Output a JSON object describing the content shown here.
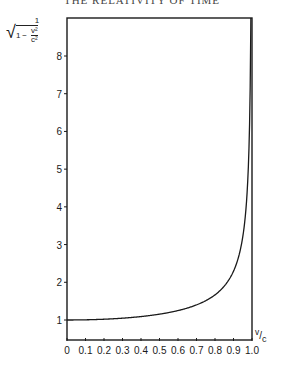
{
  "header": "THE RELATIVITY OF TIME",
  "chart_data": {
    "type": "line",
    "title": "",
    "ylabel": "1 / sqrt(1 - v^2/c^2)",
    "ylabel_parts": {
      "numerator": "1",
      "one": "1",
      "minus": "−",
      "v2": "v²",
      "c2": "c²"
    },
    "xlabel": "v/c",
    "xlabel_parts": {
      "v": "v",
      "slash": "/",
      "c": "c"
    },
    "xlim": [
      0,
      1.0
    ],
    "ylim": [
      0.5,
      9.2
    ],
    "grid": false,
    "legend": null,
    "x_ticks": [
      "0",
      "0.1",
      "0.2",
      "0.3",
      "0.4",
      "0.5",
      "0.6",
      "0.7",
      "0.8",
      "0.9",
      "1.0"
    ],
    "y_ticks": [
      "1",
      "2",
      "3",
      "4",
      "5",
      "6",
      "7",
      "8"
    ],
    "series": [
      {
        "name": "Lorentz factor",
        "x": [
          0,
          0.1,
          0.2,
          0.3,
          0.4,
          0.5,
          0.6,
          0.7,
          0.8,
          0.85,
          0.9,
          0.93,
          0.95,
          0.97,
          0.98,
          0.99,
          0.993
        ],
        "values": [
          1.0,
          1.005,
          1.021,
          1.048,
          1.091,
          1.155,
          1.25,
          1.4,
          1.667,
          1.898,
          2.294,
          2.721,
          3.203,
          4.113,
          5.025,
          7.089,
          8.466
        ]
      }
    ]
  }
}
